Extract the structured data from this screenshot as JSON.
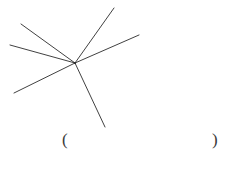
{
  "document": {
    "background_color": "#ffffff",
    "width": 237,
    "height": 169
  },
  "figure": {
    "name": "concurrent-rays-diagram",
    "stroke_color": "#2b2b2b",
    "stroke_width": 0.9,
    "vertex": {
      "x": 75,
      "y": 63,
      "label": ""
    },
    "ray_count": 6,
    "rays": [
      {
        "id": "ray-upper-left",
        "direction": "upper-left",
        "x1": 75,
        "y1": 63,
        "x2": 21,
        "y2": 24
      },
      {
        "id": "ray-left",
        "direction": "left",
        "x1": 75,
        "y1": 63,
        "x2": 10,
        "y2": 45
      },
      {
        "id": "ray-lower-left",
        "direction": "lower-left",
        "x1": 75,
        "y1": 63,
        "x2": 14,
        "y2": 93
      },
      {
        "id": "ray-upper-right",
        "direction": "upper-right",
        "x1": 75,
        "y1": 63,
        "x2": 114,
        "y2": 8
      },
      {
        "id": "ray-right",
        "direction": "right",
        "x1": 75,
        "y1": 63,
        "x2": 139,
        "y2": 35
      },
      {
        "id": "ray-lower-right",
        "direction": "lower-right",
        "x1": 75,
        "y1": 63,
        "x2": 105,
        "y2": 127
      }
    ]
  },
  "answer": {
    "open_paren": "(",
    "close_paren": ")",
    "value": "",
    "color": "#3a3a3a"
  }
}
